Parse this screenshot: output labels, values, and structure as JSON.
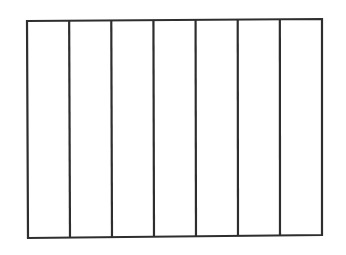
{
  "diagram": {
    "type": "rectangle-divided-into-equal-parts",
    "parts": 7,
    "orientation": "vertical-strips",
    "shaded_parts": 0,
    "stroke_color": "#2e2e2e",
    "fill_color": "#ffffff",
    "background_color": "#ffffff",
    "outer_rect": {
      "top_left": [
        27,
        21
      ],
      "top_right": [
        322,
        19
      ],
      "bottom_right": [
        322,
        235
      ],
      "bottom_left": [
        28,
        238
      ]
    },
    "stroke_width": 2.2
  }
}
